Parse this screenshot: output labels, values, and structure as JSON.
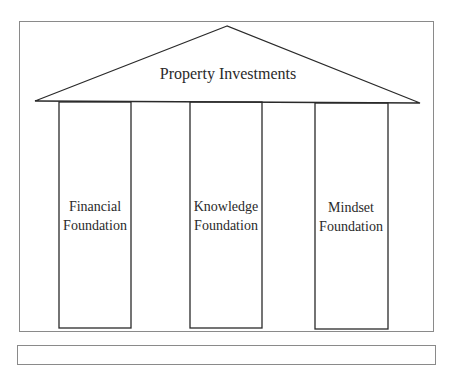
{
  "diagram": {
    "type": "temple",
    "roof": {
      "label": "Property Investments"
    },
    "pillars": [
      {
        "line1": "Financial",
        "line2": "Foundation"
      },
      {
        "line1": "Knowledge",
        "line2": "Foundation"
      },
      {
        "line1": "Mindset",
        "line2": "Foundation"
      }
    ],
    "colors": {
      "stroke": "#2a2a2a",
      "frame": "#8a8a8a",
      "background": "#ffffff"
    }
  }
}
